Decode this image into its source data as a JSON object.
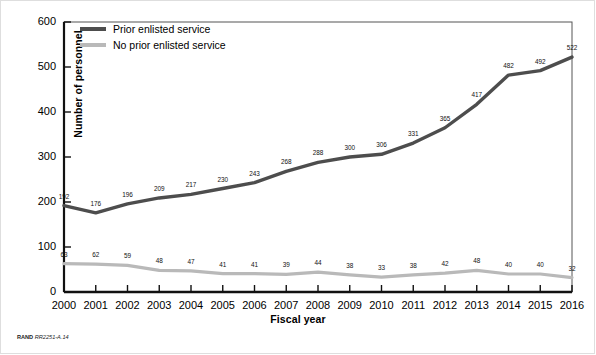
{
  "figure": {
    "credit_prefix": "RAND",
    "credit_id": "RR2251-A.14"
  },
  "chart_data": {
    "type": "line",
    "title": "",
    "xlabel": "Fiscal year",
    "ylabel": "Number of personnel",
    "categories": [
      "2000",
      "2001",
      "2002",
      "2003",
      "2004",
      "2005",
      "2006",
      "2007",
      "2008",
      "2009",
      "2010",
      "2011",
      "2012",
      "2013",
      "2014",
      "2015",
      "2016"
    ],
    "series": [
      {
        "name": "Prior enlisted service",
        "color": "#4d4d4d",
        "values": [
          192,
          176,
          196,
          209,
          217,
          230,
          243,
          268,
          288,
          300,
          306,
          331,
          365,
          417,
          482,
          492,
          522
        ]
      },
      {
        "name": "No prior enlisted service",
        "color": "#b9b9b9",
        "values": [
          63,
          62,
          59,
          48,
          47,
          41,
          41,
          39,
          44,
          38,
          33,
          38,
          42,
          48,
          40,
          40,
          32
        ]
      }
    ],
    "ylim": [
      0,
      600
    ],
    "yticks": [
      0,
      100,
      200,
      300,
      400,
      500,
      600
    ],
    "grid": false,
    "legend_position": "top-left",
    "data_labels": true
  }
}
